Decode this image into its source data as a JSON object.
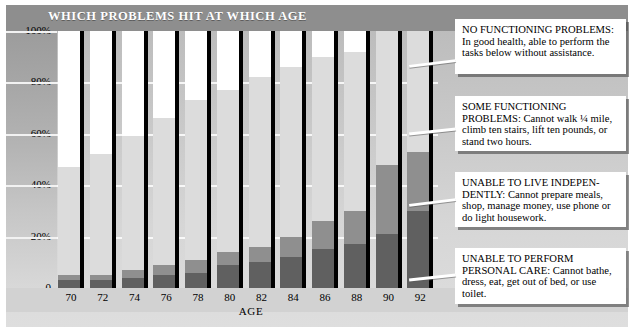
{
  "title": "WHICH PROBLEMS HIT AT WHICH AGE",
  "axis": {
    "xlabel": "AGE",
    "yticks": [
      "100%",
      "80%",
      "60%",
      "40%",
      "20%",
      "0"
    ]
  },
  "legend": [
    {
      "id": "no-functioning-problems",
      "head": "NO FUNCTIONING PROBLEMS:",
      "body": " In good health, able to perform the tasks below without assistance.",
      "color": "#ffffff"
    },
    {
      "id": "some-functioning-problems",
      "head": "SOME FUNCTIONING PROBLEMS:",
      "body": " Cannot walk ¼ mile, climb ten stairs, lift ten pounds, or stand two hours.",
      "color": "#dcdcdc"
    },
    {
      "id": "unable-to-live-independently",
      "head": "UNABLE TO LIVE INDEPEN-DENTLY:",
      "body": " Cannot prepare meals, shop, manage money, use phone or do light housework.",
      "color": "#8f8f8f"
    },
    {
      "id": "unable-to-perform-personal-care",
      "head": "UNABLE TO PERFORM PERSONAL CARE:",
      "body": " Cannot bathe, dress, eat, get out of bed, or use toilet.",
      "color": "#606060"
    }
  ],
  "chart_data": {
    "type": "bar",
    "title": "WHICH PROBLEMS HIT AT WHICH AGE",
    "xlabel": "AGE",
    "ylabel": "",
    "ylim": [
      0,
      100
    ],
    "grid": true,
    "stacked": true,
    "legend_position": "right",
    "categories": [
      "70",
      "72",
      "74",
      "76",
      "78",
      "80",
      "82",
      "84",
      "86",
      "88",
      "90",
      "92"
    ],
    "series": [
      {
        "name": "UNABLE TO PERFORM PERSONAL CARE",
        "color": "#606060",
        "values": [
          3,
          3,
          4,
          5,
          6,
          9,
          10,
          12,
          15,
          17,
          21,
          30
        ]
      },
      {
        "name": "UNABLE TO LIVE INDEPENDENTLY",
        "color": "#8f8f8f",
        "values": [
          2,
          2,
          3,
          4,
          5,
          5,
          6,
          8,
          11,
          13,
          27,
          23
        ]
      },
      {
        "name": "SOME FUNCTIONING PROBLEMS",
        "color": "#dcdcdc",
        "values": [
          42,
          47,
          52,
          57,
          62,
          63,
          66,
          66,
          64,
          62,
          52,
          47
        ]
      },
      {
        "name": "NO FUNCTIONING PROBLEMS",
        "color": "#ffffff",
        "values": [
          53,
          48,
          41,
          34,
          27,
          23,
          18,
          14,
          10,
          8,
          0,
          0
        ]
      }
    ]
  }
}
